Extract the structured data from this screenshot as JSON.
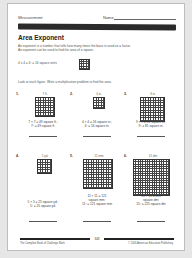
{
  "header": {
    "subject": "Measurement",
    "name_label": "Name"
  },
  "title": "Area Exponent",
  "intro": {
    "line1": "An exponent is a number that tells how many times the base is used as a factor.",
    "line2": "An exponent can be used to find the area of a square."
  },
  "example": {
    "text": "4 x 4 = 4² = 16 square units",
    "grid_size": 4
  },
  "instructions": "Look at each figure. Write a multiplication problem to find the area.",
  "problems": [
    {
      "number": "1.",
      "dimension": "7 ft.",
      "grid_size": 7,
      "answer1": "7 × 7 = 49 square ft.;",
      "answer2": "7² = 49 square ft.",
      "answer3": ""
    },
    {
      "number": "2.",
      "dimension": "4 in.",
      "grid_size": 4,
      "answer1": "4 × 4 = 16 square in.;",
      "answer2": "4² = 16 square in.",
      "answer3": ""
    },
    {
      "number": "3.",
      "dimension": "9 in.",
      "grid_size": 9,
      "answer1": "9 × 9 = 81 square in.;",
      "answer2": "9² = 81 square in.",
      "answer3": ""
    },
    {
      "number": "4.",
      "dimension": "5 yd.",
      "grid_size": 5,
      "answer1": "5 × 5 = 25 square yd.;",
      "answer2": "5² = 25 square yd.",
      "answer3": ""
    },
    {
      "number": "5.",
      "dimension": "11 mm",
      "grid_size": 11,
      "answer1": "11 × 11 = 121",
      "answer2": "square mm;",
      "answer3": "11² = 121 square mm"
    },
    {
      "number": "6.",
      "dimension": "15 dm",
      "grid_size": 15,
      "answer1": "15 × 15 = 225",
      "answer2": "square dm;",
      "answer3": "15² = 225 square dm"
    }
  ],
  "footer": {
    "page_number": "343",
    "left": "The Complete Book of Challenge Math",
    "right": "© 2005 American Education Publishing"
  }
}
